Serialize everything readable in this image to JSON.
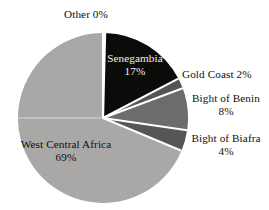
{
  "chart_data": {
    "type": "pie",
    "title": "",
    "subtitle": "",
    "xlabel": "",
    "ylabel": "",
    "legend_position": "none",
    "grid": false,
    "units": "percent",
    "categories": [
      "Other",
      "Senegambia",
      "Gold Coast",
      "Bight of Benin",
      "Bight of Biafra",
      "West Central Africa"
    ],
    "values": [
      0,
      17,
      2,
      8,
      4,
      69
    ],
    "slices": [
      {
        "name": "Other",
        "value": 0,
        "value_label": "0%",
        "color": "#fbfbfa",
        "label_text": "Other 0%",
        "label_placement": "outside-top",
        "label_color": "#100f0d"
      },
      {
        "name": "Senegambia",
        "value": 17,
        "value_label": "17%",
        "color": "#0b0b0a",
        "label_text": "Senegambia 17%",
        "label_placement": "inside",
        "label_color": "#f2f1ef"
      },
      {
        "name": "Gold Coast",
        "value": 2,
        "value_label": "2%",
        "color": "#555452",
        "label_text": "Gold Coast 2%",
        "label_placement": "outside-right",
        "label_color": "#100f0d"
      },
      {
        "name": "Bight of Benin",
        "value": 8,
        "value_label": "8%",
        "color": "#6d6c6a",
        "label_text": "Bight of Benin 8%",
        "label_placement": "outside-right",
        "label_color": "#100f0d"
      },
      {
        "name": "Bight of Biafra",
        "value": 4,
        "value_label": "4%",
        "color": "#575654",
        "label_text": "Bight of Biafra 4%",
        "label_placement": "outside-right",
        "label_color": "#100f0d"
      },
      {
        "name": "West Central Africa",
        "value": 69,
        "value_label": "69%",
        "color": "#a9a8a6",
        "label_text": "West Central Africa 69%",
        "label_placement": "inside",
        "label_color": "#100f0d"
      }
    ],
    "separator_color": "#ffffff",
    "background_color": "#ffffff"
  },
  "labels": {
    "other": "Other 0%",
    "senegambia_name": "Senegambia",
    "senegambia_value": "17%",
    "gold_coast": "Gold Coast 2%",
    "bight_benin_name": "Bight of Benin",
    "bight_benin_value": "8%",
    "bight_biafra_name": "Bight of Biafra",
    "bight_biafra_value": "4%",
    "wca_name": "West Central Africa",
    "wca_value": "69%"
  }
}
